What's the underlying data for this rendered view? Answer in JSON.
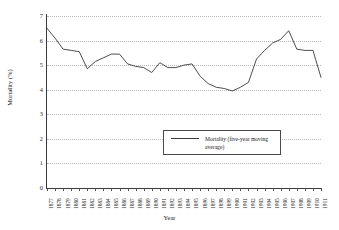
{
  "chart_data": {
    "type": "line",
    "title": "",
    "xlabel": "Year",
    "ylabel": "Mortality (%)",
    "ylim": [
      0,
      7
    ],
    "ytick_labels": [
      "0",
      "1",
      "2",
      "3",
      "4",
      "5",
      "6",
      "7"
    ],
    "grid": true,
    "legend_position": "center-right-inside",
    "legend_entries": [
      "Mortality (five-year moving average)"
    ],
    "categories": [
      "1877",
      "1878",
      "1879",
      "1880",
      "1881",
      "1882",
      "1883",
      "1884",
      "1885",
      "1886",
      "1887",
      "1888",
      "1889",
      "1890",
      "1891",
      "1892",
      "1893",
      "1894",
      "1895",
      "1896",
      "1897",
      "1898",
      "1899",
      "1900",
      "1901",
      "1902",
      "1903",
      "1904",
      "1905",
      "1906",
      "1907",
      "1908",
      "1909",
      "1910",
      "1911"
    ],
    "series": [
      {
        "name": "Mortality (five-year moving average)",
        "values": [
          6.5,
          6.1,
          5.65,
          5.6,
          5.55,
          4.85,
          5.15,
          5.3,
          5.45,
          5.45,
          5.05,
          4.95,
          4.9,
          4.7,
          5.1,
          4.9,
          4.9,
          5.0,
          5.05,
          4.55,
          4.25,
          4.1,
          4.05,
          3.95,
          4.1,
          4.3,
          5.25,
          5.6,
          5.9,
          6.05,
          6.4,
          5.65,
          5.6,
          5.6,
          4.5
        ]
      }
    ]
  },
  "legend": {
    "label": "Mortality (five-year moving average)"
  },
  "axes": {
    "y_title": "Mortality (%)",
    "x_title": "Year"
  }
}
